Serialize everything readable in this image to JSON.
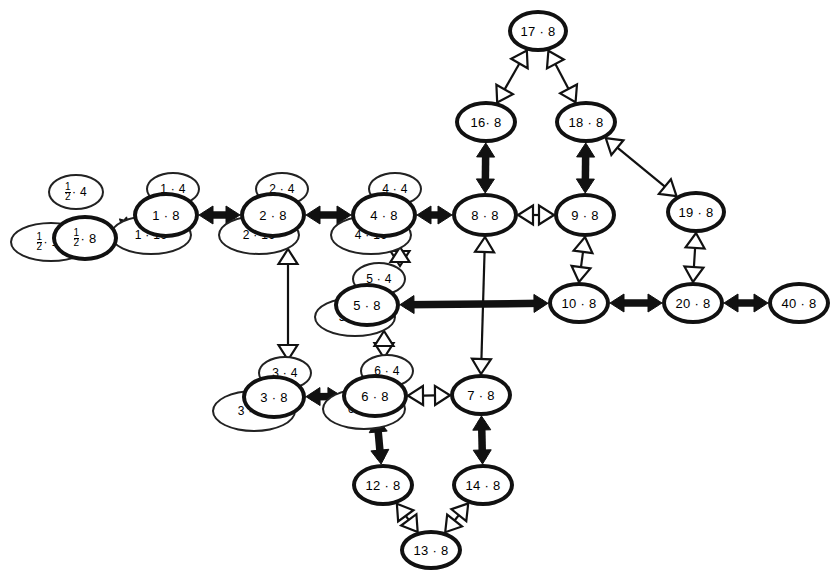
{
  "diagram": {
    "type": "directed-graph",
    "title": "",
    "background_color": "#ffffff",
    "stroke_color": "#111111",
    "edge_styles": {
      "solid_bold_double": "thick filled double-headed arrow",
      "hollow_double": "outline double-headed arrow",
      "solid_bold_single": "thick filled single-headed arrow",
      "hollow_single": "outline single-headed arrow"
    }
  },
  "nodes": [
    {
      "id": "half",
      "label": "½ · 8",
      "num": "1",
      "den": "2",
      "mult": "8",
      "kind": "main",
      "x": 52,
      "y": 215,
      "w": 66,
      "h": 46
    },
    {
      "id": "half4",
      "label": "½ · 4",
      "num": "1",
      "den": "2",
      "mult": "4",
      "kind": "sat4",
      "x": 48,
      "y": 174,
      "w": 56,
      "h": 36
    },
    {
      "id": "half16",
      "label": "½ · 16",
      "num": "1",
      "den": "2",
      "mult": "16",
      "kind": "sat16",
      "x": 10,
      "y": 222,
      "w": 82,
      "h": 40
    },
    {
      "id": "n1",
      "label": "1 · 8",
      "mult": "8",
      "kind": "main",
      "x": 133,
      "y": 192,
      "w": 66,
      "h": 46
    },
    {
      "id": "n1_4",
      "label": "1 · 4",
      "mult": "4",
      "kind": "sat4",
      "x": 146,
      "y": 172,
      "w": 54,
      "h": 34
    },
    {
      "id": "n1_16",
      "label": "1 · 16",
      "mult": "16",
      "kind": "sat16",
      "x": 110,
      "y": 215,
      "w": 82,
      "h": 40
    },
    {
      "id": "n2",
      "label": "2 · 8",
      "mult": "8",
      "kind": "main",
      "x": 240,
      "y": 192,
      "w": 66,
      "h": 46
    },
    {
      "id": "n2_4",
      "label": "2 · 4",
      "mult": "4",
      "kind": "sat4",
      "x": 255,
      "y": 172,
      "w": 54,
      "h": 34
    },
    {
      "id": "n2_16",
      "label": "2 · 16",
      "mult": "16",
      "kind": "sat16",
      "x": 218,
      "y": 215,
      "w": 82,
      "h": 40
    },
    {
      "id": "n4",
      "label": "4 · 8",
      "mult": "8",
      "kind": "main",
      "x": 351,
      "y": 192,
      "w": 66,
      "h": 46
    },
    {
      "id": "n4_4",
      "label": "4 · 4",
      "mult": "4",
      "kind": "sat4",
      "x": 368,
      "y": 172,
      "w": 54,
      "h": 34
    },
    {
      "id": "n4_16",
      "label": "4 · 16",
      "mult": "16",
      "kind": "sat16",
      "x": 330,
      "y": 215,
      "w": 82,
      "h": 40
    },
    {
      "id": "n8",
      "label": "8 · 8",
      "mult": "8",
      "kind": "main",
      "x": 452,
      "y": 193,
      "w": 66,
      "h": 44
    },
    {
      "id": "n9",
      "label": "9 · 8",
      "mult": "8",
      "kind": "main",
      "x": 554,
      "y": 193,
      "w": 62,
      "h": 44
    },
    {
      "id": "n16",
      "label": "16· 8",
      "mult": "8",
      "kind": "main",
      "x": 455,
      "y": 101,
      "w": 62,
      "h": 42
    },
    {
      "id": "n18",
      "label": "18 · 8",
      "mult": "8",
      "kind": "main",
      "x": 555,
      "y": 101,
      "w": 62,
      "h": 42
    },
    {
      "id": "n17",
      "label": "17 · 8",
      "mult": "8",
      "kind": "main",
      "x": 508,
      "y": 10,
      "w": 60,
      "h": 42
    },
    {
      "id": "n19",
      "label": "19 · 8",
      "mult": "8",
      "kind": "main",
      "x": 666,
      "y": 191,
      "w": 60,
      "h": 42
    },
    {
      "id": "n10",
      "label": "10 · 8",
      "mult": "8",
      "kind": "main",
      "x": 548,
      "y": 282,
      "w": 62,
      "h": 42
    },
    {
      "id": "n20",
      "label": "20 · 8",
      "mult": "8",
      "kind": "main",
      "x": 662,
      "y": 282,
      "w": 62,
      "h": 42
    },
    {
      "id": "n40",
      "label": "40 · 8",
      "mult": "8",
      "kind": "main",
      "x": 768,
      "y": 282,
      "w": 62,
      "h": 42
    },
    {
      "id": "n5",
      "label": "5 · 8",
      "mult": "8",
      "kind": "main",
      "x": 334,
      "y": 283,
      "w": 66,
      "h": 44
    },
    {
      "id": "n5_4",
      "label": "5 · 4",
      "mult": "4",
      "kind": "sat4",
      "x": 352,
      "y": 262,
      "w": 54,
      "h": 34
    },
    {
      "id": "n5_16",
      "label": "5 · 16",
      "mult": "16",
      "kind": "sat16",
      "x": 314,
      "y": 297,
      "w": 82,
      "h": 40
    },
    {
      "id": "n3",
      "label": "3 · 8",
      "mult": "8",
      "kind": "main",
      "x": 242,
      "y": 375,
      "w": 64,
      "h": 44
    },
    {
      "id": "n3_4",
      "label": "3 · 4",
      "mult": "4",
      "kind": "sat4",
      "x": 258,
      "y": 356,
      "w": 54,
      "h": 34
    },
    {
      "id": "n3_16",
      "label": "3 · 16",
      "mult": "16",
      "kind": "sat16",
      "x": 212,
      "y": 390,
      "w": 84,
      "h": 42
    },
    {
      "id": "n6",
      "label": "6 · 8",
      "mult": "8",
      "kind": "main",
      "x": 342,
      "y": 374,
      "w": 66,
      "h": 44
    },
    {
      "id": "n6_4",
      "label": "6 · 4",
      "mult": "4",
      "kind": "sat4",
      "x": 360,
      "y": 354,
      "w": 54,
      "h": 34
    },
    {
      "id": "n6_16",
      "label": "6 · 16",
      "mult": "16",
      "kind": "sat16",
      "x": 322,
      "y": 388,
      "w": 84,
      "h": 42
    },
    {
      "id": "n7",
      "label": "7 · 8",
      "mult": "8",
      "kind": "main",
      "x": 450,
      "y": 374,
      "w": 62,
      "h": 42
    },
    {
      "id": "n12",
      "label": "12 · 8",
      "mult": "8",
      "kind": "main",
      "x": 352,
      "y": 464,
      "w": 62,
      "h": 42
    },
    {
      "id": "n14",
      "label": "14 · 8",
      "mult": "8",
      "kind": "main",
      "x": 452,
      "y": 464,
      "w": 62,
      "h": 42
    },
    {
      "id": "n13",
      "label": "13 · 8",
      "mult": "8",
      "kind": "main",
      "x": 400,
      "y": 530,
      "w": 62,
      "h": 40
    }
  ],
  "edges": [
    {
      "from": "half",
      "to": "n1",
      "style": "solid_bold_double"
    },
    {
      "from": "n1",
      "to": "n2",
      "style": "solid_bold_double"
    },
    {
      "from": "n2",
      "to": "n4",
      "style": "solid_bold_double"
    },
    {
      "from": "n4",
      "to": "n8",
      "style": "solid_bold_double"
    },
    {
      "from": "n8",
      "to": "n9",
      "style": "hollow_double"
    },
    {
      "from": "n8",
      "to": "n16",
      "style": "solid_bold_double"
    },
    {
      "from": "n9",
      "to": "n18",
      "style": "solid_bold_double"
    },
    {
      "from": "n16",
      "to": "n17",
      "style": "hollow_double"
    },
    {
      "from": "n18",
      "to": "n17",
      "style": "hollow_double"
    },
    {
      "from": "n18",
      "to": "n19",
      "style": "hollow_double"
    },
    {
      "from": "n19",
      "to": "n20",
      "style": "hollow_double"
    },
    {
      "from": "n9",
      "to": "n10",
      "style": "hollow_double"
    },
    {
      "from": "n5",
      "to": "n10",
      "style": "solid_bold_double"
    },
    {
      "from": "n10",
      "to": "n20",
      "style": "solid_bold_double"
    },
    {
      "from": "n20",
      "to": "n40",
      "style": "solid_bold_double"
    },
    {
      "from": "n8",
      "to": "n7",
      "style": "hollow_double"
    },
    {
      "from": "n2_16",
      "to": "n3_4",
      "style": "hollow_double"
    },
    {
      "from": "n4_16",
      "to": "n5_4",
      "style": "hollow_double"
    },
    {
      "from": "n5_16",
      "to": "n6_4",
      "style": "hollow_double"
    },
    {
      "from": "n3",
      "to": "n6",
      "style": "solid_bold_double"
    },
    {
      "from": "n6",
      "to": "n7",
      "style": "hollow_double"
    },
    {
      "from": "n6",
      "to": "n12",
      "style": "solid_bold_double"
    },
    {
      "from": "n7",
      "to": "n14",
      "style": "solid_bold_double"
    },
    {
      "from": "n12",
      "to": "n13",
      "style": "hollow_double"
    },
    {
      "from": "n14",
      "to": "n13",
      "style": "hollow_double"
    }
  ]
}
